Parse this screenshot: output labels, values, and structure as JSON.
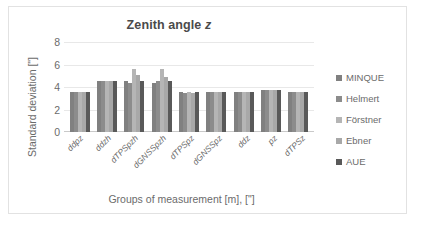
{
  "chart_data": {
    "type": "bar",
    "title": "Zenith angle z",
    "title_plain": "Zenith angle",
    "title_italic": "z",
    "xlabel": "Groups of measurement [m], [\"]",
    "ylabel": "Standard deviation [\"]",
    "ylim": [
      0,
      8
    ],
    "yticks": [
      0,
      2,
      4,
      6,
      8
    ],
    "grid": true,
    "legend_position": "right",
    "categories": [
      "ddpz",
      "ddzh",
      "dTPSpzh",
      "dGNSSpzh",
      "dTPSpz",
      "dGNSSpz",
      "ddz",
      "pz",
      "dTPSz"
    ],
    "series": [
      {
        "name": "MINQUE",
        "color": "#808080",
        "values": [
          3.6,
          4.5,
          4.5,
          4.4,
          3.6,
          3.6,
          3.6,
          3.7,
          3.6
        ]
      },
      {
        "name": "Helmert",
        "color": "#8c8c8c",
        "values": [
          3.6,
          4.5,
          4.4,
          4.5,
          3.5,
          3.6,
          3.6,
          3.7,
          3.6
        ]
      },
      {
        "name": "Förstner",
        "color": "#b5b5b5",
        "values": [
          3.6,
          4.5,
          5.6,
          5.6,
          3.6,
          3.6,
          3.6,
          3.7,
          3.6
        ]
      },
      {
        "name": "Ebner",
        "color": "#a8a8a8",
        "values": [
          3.6,
          4.5,
          5.1,
          4.9,
          3.5,
          3.6,
          3.6,
          3.7,
          3.6
        ]
      },
      {
        "name": "AUE",
        "color": "#595959",
        "values": [
          3.6,
          4.5,
          4.5,
          4.5,
          3.6,
          3.6,
          3.6,
          3.7,
          3.6
        ]
      }
    ]
  }
}
